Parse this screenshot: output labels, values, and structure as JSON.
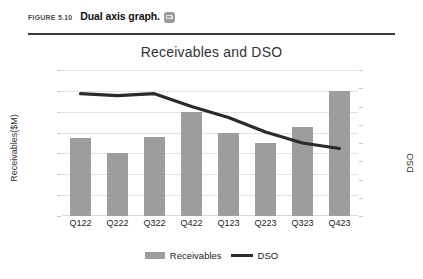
{
  "caption": {
    "figure_number": "FIGURE 5.10",
    "figure_title": "Dual axis graph.",
    "icon": "media-thumbnail-icon"
  },
  "chart_data": {
    "type": "bar",
    "title": "Receivables and DSO",
    "xlabel": "",
    "ylabel": "Receivables($M)",
    "y2label": "DSO",
    "categories": [
      "Q122",
      "Q222",
      "Q322",
      "Q422",
      "Q123",
      "Q223",
      "Q323",
      "Q423"
    ],
    "ylim": [
      0,
      140
    ],
    "y2lim": [
      40,
      80
    ],
    "yticks": [
      0,
      20,
      40,
      60,
      80,
      100,
      120,
      140
    ],
    "y2ticks": [
      40,
      45,
      50,
      55,
      60,
      65,
      70,
      75,
      80
    ],
    "grid": true,
    "legend_position": "bottom",
    "series": [
      {
        "name": "Receivables",
        "type": "bar",
        "axis": "left",
        "color": "#9d9d9d",
        "values": [
          75,
          60,
          76,
          100,
          80,
          70,
          85,
          120
        ]
      },
      {
        "name": "DSO",
        "type": "line",
        "axis": "right",
        "color": "#2b2b2b",
        "values": [
          73.5,
          73,
          73.5,
          70,
          67,
          63,
          60,
          58.5
        ]
      }
    ]
  },
  "legend": {
    "items": [
      {
        "label": "Receivables",
        "marker": "bar-swatch"
      },
      {
        "label": "DSO",
        "marker": "line-swatch"
      }
    ]
  }
}
